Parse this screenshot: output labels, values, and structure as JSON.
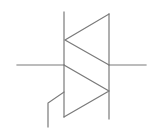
{
  "diagram": {
    "type": "schematic-symbol",
    "symbol": "triac",
    "stroke_color": "#7a7a7a",
    "background": "#ffffff",
    "elements": {
      "left_terminal": {
        "x1": 17,
        "y1": 65,
        "x2": 64,
        "y2": 65
      },
      "right_terminal": {
        "x1": 109,
        "y1": 65,
        "x2": 146,
        "y2": 65
      },
      "left_bar": {
        "x": 64,
        "y1": 12,
        "y2": 117
      },
      "right_bar": {
        "x": 109,
        "y1": 14,
        "y2": 119
      },
      "upper_triangle": {
        "points": "109,14 65,40 109,65",
        "direction": "left"
      },
      "lower_triangle": {
        "points": "64,65 109,91 64,117",
        "direction": "right"
      },
      "gate": {
        "points": "64,92 48,103 48,127"
      }
    }
  }
}
